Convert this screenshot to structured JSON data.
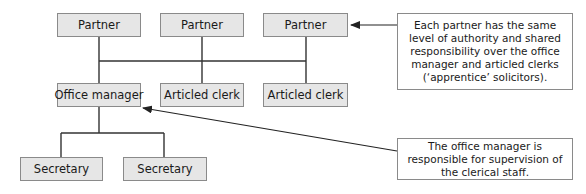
{
  "diagram": {
    "nodes": {
      "partner_1": "Partner",
      "partner_2": "Partner",
      "partner_3": "Partner",
      "office_manager": "Office manager",
      "articled_clerk_1": "Articled clerk",
      "articled_clerk_2": "Articled clerk",
      "secretary_1": "Secretary",
      "secretary_2": "Secretary"
    },
    "callouts": {
      "partners_note": "Each partner has the same level of authority and shared responsibility over the office manager and articled clerks (‘apprentice’ solicitors).",
      "office_manager_note": "The office manager is responsible for supervision of the clerical staff."
    },
    "colors": {
      "box_fill": "#e6e6e6",
      "box_border": "#8a8a8a",
      "line": "#333333"
    }
  }
}
